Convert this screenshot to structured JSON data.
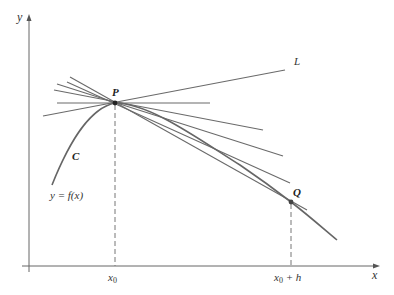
{
  "labels": {
    "y_axis": "y",
    "x_axis": "x",
    "point_p": "P",
    "point_q": "Q",
    "line_l": "L",
    "curve_c": "C",
    "function": "y = f(x)",
    "x0": "x",
    "x0_sub": "0",
    "x0h": "x",
    "x0h_sub": "0",
    "x0h_rest": " + h"
  },
  "colors": {
    "ink": "#666666",
    "text": "#333333",
    "background": "#ffffff"
  },
  "geometry": {
    "P": [
      115,
      103
    ],
    "Q": [
      291,
      202
    ],
    "secant_lines": [
      {
        "from": [
          70,
          77
        ],
        "to": [
          307,
          210
        ],
        "note": "secant PQ"
      },
      {
        "from": [
          67,
          82
        ],
        "to": [
          290,
          183
        ]
      },
      {
        "from": [
          57,
          84
        ],
        "to": [
          283,
          156
        ]
      },
      {
        "from": [
          54,
          90
        ],
        "to": [
          263,
          130
        ]
      },
      {
        "from": [
          57,
          103
        ],
        "to": [
          210,
          103
        ],
        "note": "horizontal"
      },
      {
        "from": [
          43,
          116
        ],
        "to": [
          285,
          70
        ],
        "note": "tangent L"
      }
    ]
  }
}
